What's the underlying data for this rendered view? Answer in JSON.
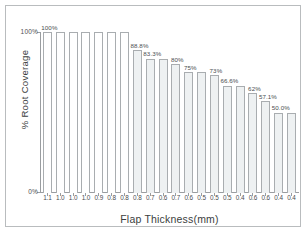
{
  "figure": {
    "caption_strip": ""
  },
  "chart_data": {
    "type": "bar",
    "title": "",
    "xlabel": "Flap Thickness(mm)",
    "ylabel": "% Root Coverage",
    "ylim": [
      0,
      100
    ],
    "ytick_labels": [
      "100%",
      "0%"
    ],
    "grid": false,
    "legend": null,
    "categories": [
      "1.1",
      "1.0",
      "1.0",
      "1.0",
      "0.9",
      "0.8",
      "0.8",
      "0.8",
      "0.7",
      "0.6",
      "0.7",
      "0.6",
      "0.5",
      "0.5",
      "0.5",
      "0.4",
      "0.6",
      "0.6",
      "0.4",
      "0.4"
    ],
    "values": [
      100,
      100,
      100,
      100,
      100,
      100,
      100,
      88.8,
      83.3,
      83.3,
      80,
      75,
      75,
      73,
      66.6,
      66.6,
      62,
      57.1,
      50.0,
      50.0
    ],
    "point_labels": [
      "100%",
      "",
      "",
      "",
      "",
      "",
      "",
      "88.8%",
      "83.3%",
      "",
      "80%",
      "75%",
      "",
      "73%",
      "66.6%",
      "",
      "62%",
      "57.1%",
      "50.0%",
      ""
    ],
    "bar_styles": [
      "open",
      "open",
      "open",
      "open",
      "open",
      "open",
      "open",
      "shaded",
      "shaded",
      "shaded",
      "shaded",
      "shaded",
      "shaded",
      "shaded",
      "shaded",
      "shaded",
      "shaded",
      "shaded",
      "shaded",
      "shaded"
    ]
  },
  "colors": {
    "bar_outline": "#a9adb0",
    "bar_fill_shaded": "#eef1f2",
    "bar_fill_open": "#ffffff",
    "axis": "#9a9da0",
    "text": "#3b3e40",
    "frame": "#b9bcbe",
    "background": "#ffffff"
  }
}
